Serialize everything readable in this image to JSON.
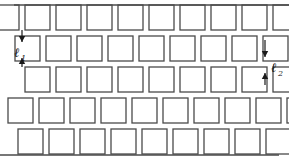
{
  "figure": {
    "background_color": "#ffffff",
    "line_color": "#4a4a4a",
    "annotation_color": "#1a1a1a",
    "width": 289,
    "height": 162
  },
  "geometry": {
    "cell_size": 25,
    "cell_gap": 6,
    "row_pitch": 31,
    "rows": [
      {
        "index": 1,
        "y": 5,
        "x_start": -6,
        "count": 10,
        "clipped_top": true,
        "clipped_bottom": false
      },
      {
        "index": 2,
        "y": 36,
        "x_start": 15,
        "count": 10,
        "clipped_top": false,
        "clipped_bottom": false
      },
      {
        "index": 3,
        "y": 67,
        "x_start": 25,
        "count": 9,
        "clipped_top": false,
        "clipped_bottom": false
      },
      {
        "index": 4,
        "y": 98,
        "x_start": 8,
        "count": 10,
        "clipped_top": false,
        "clipped_bottom": false
      },
      {
        "index": 5,
        "y": 129,
        "x_start": 18,
        "count": 10,
        "clipped_top": false,
        "clipped_bottom": true
      }
    ]
  },
  "edges": {
    "top_line": {
      "y": 5,
      "x1": 14,
      "x2": 289
    },
    "bottom_line": {
      "y": 155,
      "x1": 0,
      "x2": 279
    }
  },
  "annotations": {
    "dimension_1": {
      "symbol": "ℓ",
      "subscript": "1",
      "label": "ℓ1",
      "orientation": "vertical",
      "x": 22,
      "y_top": 30,
      "y_bottom": 67,
      "text_x": 14,
      "text_y": 53,
      "description": "vertical pitch between cell rows"
    },
    "dimension_2": {
      "symbol": "ℓ",
      "subscript": "2",
      "label": "ℓ2",
      "orientation": "vertical",
      "x": 265,
      "y_top": 40,
      "y_bottom": 85,
      "text_x": 271,
      "text_y": 68,
      "description": "vertical gap dimension at right edge"
    }
  }
}
